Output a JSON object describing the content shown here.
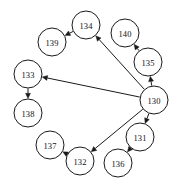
{
  "diagram": {
    "type": "directed-graph",
    "title": "",
    "background_color": "#ffffff",
    "node_fill": "#ffffff",
    "node_stroke": "#1a1a1a",
    "edge_color": "#1a1a1a",
    "node_radius": 14,
    "nodes": [
      {
        "id": "130",
        "label": "130",
        "cx": 154,
        "cy": 100
      },
      {
        "id": "131",
        "label": "131",
        "cx": 140,
        "cy": 137
      },
      {
        "id": "132",
        "label": "132",
        "cx": 80,
        "cy": 161
      },
      {
        "id": "133",
        "label": "133",
        "cx": 28,
        "cy": 74
      },
      {
        "id": "134",
        "label": "134",
        "cx": 86,
        "cy": 25
      },
      {
        "id": "135",
        "label": "135",
        "cx": 148,
        "cy": 62
      },
      {
        "id": "136",
        "label": "136",
        "cx": 118,
        "cy": 163
      },
      {
        "id": "137",
        "label": "137",
        "cx": 50,
        "cy": 145
      },
      {
        "id": "138",
        "label": "138",
        "cx": 28,
        "cy": 113
      },
      {
        "id": "139",
        "label": "139",
        "cx": 52,
        "cy": 42
      },
      {
        "id": "140",
        "label": "140",
        "cx": 125,
        "cy": 33
      }
    ],
    "edges": [
      {
        "from": "130",
        "to": "135",
        "directed": true
      },
      {
        "from": "130",
        "to": "134",
        "directed": true
      },
      {
        "from": "130",
        "to": "133",
        "directed": true
      },
      {
        "from": "130",
        "to": "132",
        "directed": true
      },
      {
        "from": "130",
        "to": "131",
        "directed": true
      },
      {
        "from": "135",
        "to": "140",
        "directed": true
      },
      {
        "from": "134",
        "to": "139",
        "directed": true
      },
      {
        "from": "133",
        "to": "138",
        "directed": true
      },
      {
        "from": "132",
        "to": "137",
        "directed": true
      },
      {
        "from": "131",
        "to": "136",
        "directed": true
      }
    ]
  }
}
